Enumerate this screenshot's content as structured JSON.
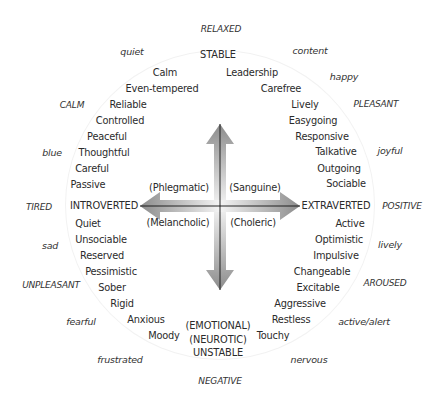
{
  "diagram": {
    "axes": {
      "top": "STABLE",
      "bottom_lines": [
        "(EMOTIONAL)",
        "(NEUROTIC)",
        "UNSTABLE"
      ],
      "left": "INTROVERTED",
      "right": "EXTRAVERTED"
    },
    "temperaments": {
      "upper_left": "(Phlegmatic)",
      "upper_right": "(Sanguine)",
      "lower_left": "(Melancholic)",
      "lower_right": "(Choleric)"
    },
    "traits": {
      "upper_left": [
        "Calm",
        "Even-tempered",
        "Reliable",
        "Controlled",
        "Peaceful",
        "Thoughtful",
        "Careful",
        "Passive"
      ],
      "upper_right": [
        "Leadership",
        "Carefree",
        "Lively",
        "Easygoing",
        "Responsive",
        "Talkative",
        "Outgoing",
        "Sociable"
      ],
      "lower_left": [
        "Quiet",
        "Unsociable",
        "Reserved",
        "Pessimistic",
        "Sober",
        "Rigid",
        "Anxious",
        "Moody"
      ],
      "lower_right": [
        "Active",
        "Optimistic",
        "Impulsive",
        "Changeable",
        "Excitable",
        "Aggressive",
        "Restless",
        "Touchy"
      ]
    },
    "moods": {
      "top": "RELAXED",
      "bottom": "NEGATIVE",
      "left": "TIRED",
      "right": "POSITIVE",
      "upper_left": [
        "quiet",
        "CALM",
        "blue"
      ],
      "upper_right": [
        "content",
        "happy",
        "PLEASANT",
        "joyful"
      ],
      "lower_left": [
        "sad",
        "UNPLEASANT",
        "fearful",
        "frustrated"
      ],
      "lower_right": [
        "lively",
        "AROUSED",
        "active/alert",
        "nervous"
      ]
    },
    "colors": {
      "ring_shadow": "#cfcfcf",
      "disc": "#ffffff",
      "arrow_dark": "#8a8a8a",
      "arrow_light": "#f0f0f0",
      "axis_line": "#111111",
      "text": "#2b2b2b"
    }
  }
}
